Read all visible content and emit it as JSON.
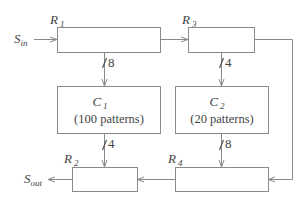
{
  "diagram": {
    "registers": [
      {
        "id": "R1",
        "main": "R",
        "sub": "1"
      },
      {
        "id": "R2",
        "main": "R",
        "sub": "2"
      },
      {
        "id": "R3",
        "main": "R",
        "sub": "3"
      },
      {
        "id": "R4",
        "main": "R",
        "sub": "4"
      }
    ],
    "circuits": [
      {
        "id": "C1",
        "main": "C",
        "sub": "1",
        "patterns": "(100 patterns)"
      },
      {
        "id": "C2",
        "main": "C",
        "sub": "2",
        "patterns": "(20 patterns)"
      }
    ],
    "signals": {
      "input": {
        "main": "S",
        "sub": "in"
      },
      "output": {
        "main": "S",
        "sub": "out"
      }
    },
    "bus_widths": {
      "R1_to_C1": "8",
      "R3_to_C2": "4",
      "C1_to_R2": "4",
      "C2_to_R4": "8"
    },
    "colors": {
      "line": "#8a8a8a",
      "text": "#444444"
    }
  }
}
